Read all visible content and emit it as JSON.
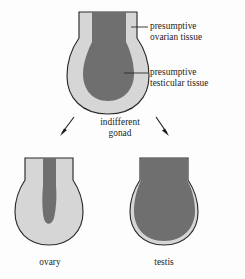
{
  "figure": {
    "background_color": "#fdfdfd",
    "outline_color": "#2b2b2b",
    "cortex_color": "#d6d6d6",
    "medulla_color": "#6f6f6f",
    "leader_color": "#2b2b2b",
    "arrow_color": "#1a1a1a"
  },
  "labels": {
    "ovarian_line1": "presumptive",
    "ovarian_line2": "ovarian tissue",
    "testicular_line1": "presumptive",
    "testicular_line2": "testicular tissue",
    "indifferent_line1": "indifferent",
    "indifferent_line2": "gonad",
    "ovary": "ovary",
    "testis": "testis"
  },
  "structures": [
    {
      "name": "indifferent-gonad",
      "label": "indifferent gonad",
      "cortex": "presumptive ovarian tissue",
      "medulla": "presumptive testicular tissue",
      "medulla_extent": "large central teardrop reaching two-thirds down"
    },
    {
      "name": "ovary",
      "label": "ovary",
      "cortex": "ovarian tissue expanded, fills most of gonad",
      "medulla": "testicular tissue regressed to a narrow central streak"
    },
    {
      "name": "testis",
      "label": "testis",
      "cortex": "ovarian tissue reduced to thin outer rim",
      "medulla": "testicular tissue expanded, fills most of gonad"
    }
  ],
  "arrows": [
    {
      "name": "arrow-to-ovary",
      "direction": "down-left",
      "from": "indifferent gonad",
      "to": "ovary"
    },
    {
      "name": "arrow-to-testis",
      "direction": "down-right",
      "from": "indifferent gonad",
      "to": "testis"
    }
  ]
}
